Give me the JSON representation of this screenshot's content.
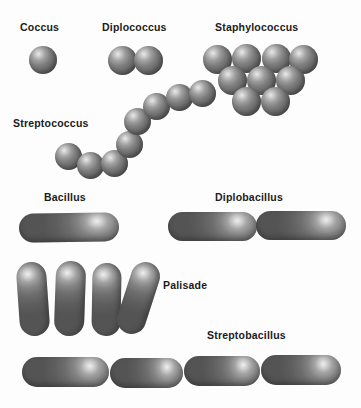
{
  "figure": {
    "background_color": "#fdfdfd",
    "cell_color": "#707070",
    "label_color": "#1b1b1b",
    "width": 361,
    "height": 408
  },
  "labels": {
    "coccus": "Coccus",
    "diplococcus": "Diplococcus",
    "staphylococcus": "Staphylococcus",
    "streptococcus": "Streptococcus",
    "bacillus": "Bacillus",
    "diplobacillus": "Diplobacillus",
    "palisade": "Palisade",
    "streptobacillus": "Streptobacillus"
  },
  "groups": [
    {
      "name": "coccus",
      "label": "Coccus",
      "shape": "sphere",
      "count": 1,
      "cells": [
        {
          "x": 29,
          "y": 46,
          "d": 28
        }
      ]
    },
    {
      "name": "diplococcus",
      "label": "Diplococcus",
      "shape": "sphere",
      "count": 2,
      "cells": [
        {
          "x": 108,
          "y": 46,
          "d": 29
        },
        {
          "x": 134,
          "y": 46,
          "d": 29
        }
      ]
    },
    {
      "name": "staphylococcus",
      "label": "Staphylococcus",
      "shape": "sphere",
      "count": 9,
      "arrangement": "grape-like cluster, rows of 4, 3, 2",
      "cells": [
        {
          "x": 203,
          "y": 45,
          "d": 29
        },
        {
          "x": 232,
          "y": 44,
          "d": 29
        },
        {
          "x": 262,
          "y": 44,
          "d": 29
        },
        {
          "x": 289,
          "y": 45,
          "d": 29
        },
        {
          "x": 218,
          "y": 66,
          "d": 29
        },
        {
          "x": 247,
          "y": 66,
          "d": 29
        },
        {
          "x": 276,
          "y": 66,
          "d": 29
        },
        {
          "x": 232,
          "y": 87,
          "d": 29
        },
        {
          "x": 261,
          "y": 87,
          "d": 29
        }
      ]
    },
    {
      "name": "streptococcus",
      "label": "Streptococcus",
      "shape": "sphere",
      "count": 8,
      "arrangement": "curved chain",
      "cells": [
        {
          "x": 55,
          "y": 143,
          "d": 27
        },
        {
          "x": 77,
          "y": 152,
          "d": 27
        },
        {
          "x": 101,
          "y": 150,
          "d": 27
        },
        {
          "x": 116,
          "y": 131,
          "d": 27
        },
        {
          "x": 124,
          "y": 108,
          "d": 27
        },
        {
          "x": 143,
          "y": 93,
          "d": 27
        },
        {
          "x": 166,
          "y": 84,
          "d": 27
        },
        {
          "x": 189,
          "y": 80,
          "d": 27
        }
      ]
    },
    {
      "name": "bacillus",
      "label": "Bacillus",
      "shape": "rod",
      "count": 1,
      "cells": [
        {
          "x": 19,
          "y": 213,
          "w": 100,
          "h": 29,
          "rot": -1
        }
      ]
    },
    {
      "name": "diplobacillus",
      "label": "Diplobacillus",
      "shape": "rod",
      "count": 2,
      "arrangement": "pair end to end",
      "cells": [
        {
          "x": 168,
          "y": 212,
          "w": 89,
          "h": 29,
          "rot": 0
        },
        {
          "x": 256,
          "y": 211,
          "w": 90,
          "h": 29,
          "rot": 0
        }
      ]
    },
    {
      "name": "palisade",
      "label": "Palisade",
      "shape": "rod",
      "count": 4,
      "arrangement": "side-by-side vertical rods",
      "cells": [
        {
          "x": 18,
          "y": 262,
          "w": 30,
          "h": 74,
          "rot": -4
        },
        {
          "x": 55,
          "y": 261,
          "w": 30,
          "h": 75,
          "rot": 2
        },
        {
          "x": 92,
          "y": 263,
          "w": 29,
          "h": 73,
          "rot": 1
        },
        {
          "x": 124,
          "y": 261,
          "w": 29,
          "h": 74,
          "rot": 18
        }
      ]
    },
    {
      "name": "streptobacillus",
      "label": "Streptobacillus",
      "shape": "rod",
      "count": 4,
      "arrangement": "chain of rods end to end",
      "cells": [
        {
          "x": 22,
          "y": 357,
          "w": 87,
          "h": 30,
          "rot": 0
        },
        {
          "x": 110,
          "y": 358,
          "w": 73,
          "h": 30,
          "rot": 0
        },
        {
          "x": 184,
          "y": 356,
          "w": 76,
          "h": 30,
          "rot": 0
        },
        {
          "x": 261,
          "y": 355,
          "w": 80,
          "h": 30,
          "rot": 0
        }
      ]
    }
  ],
  "label_positions": {
    "coccus": {
      "x": 20,
      "y": 22
    },
    "diplococcus": {
      "x": 102,
      "y": 22
    },
    "staphylococcus": {
      "x": 215,
      "y": 22
    },
    "streptococcus": {
      "x": 13,
      "y": 118
    },
    "bacillus": {
      "x": 44,
      "y": 192
    },
    "diplobacillus": {
      "x": 215,
      "y": 192
    },
    "palisade": {
      "x": 163,
      "y": 280
    },
    "streptobacillus": {
      "x": 207,
      "y": 330
    }
  }
}
